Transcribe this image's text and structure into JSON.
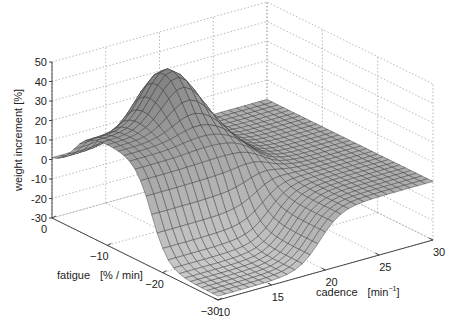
{
  "chart_data": {
    "type": "surface",
    "title": "",
    "xlabel": "cadence",
    "xunit": "min",
    "xunit_sup": "−1",
    "ylabel": "fatigue",
    "yunit": "[% / min]",
    "zlabel": "weight  increment  [%]",
    "x_range": [
      10,
      30
    ],
    "y_range": [
      -30,
      0
    ],
    "z_range": [
      -30,
      50
    ],
    "x_ticks": [
      10,
      15,
      20,
      25,
      30
    ],
    "y_ticks": [
      0,
      -10,
      -20,
      -30
    ],
    "z_ticks": [
      -30,
      -20,
      -10,
      0,
      10,
      20,
      30,
      40,
      50
    ],
    "grid": true,
    "colormap": "gray",
    "sample_points": [
      {
        "cadence": 10,
        "fatigue": 0,
        "z": 0
      },
      {
        "cadence": 30,
        "fatigue": 0,
        "z": 0
      },
      {
        "cadence": 15,
        "fatigue": -10,
        "z": 20
      },
      {
        "cadence": 12,
        "fatigue": -8,
        "z": 25
      },
      {
        "cadence": 20,
        "fatigue": -4,
        "z": 50
      },
      {
        "cadence": 25,
        "fatigue": -15,
        "z": 0
      },
      {
        "cadence": 12,
        "fatigue": -25,
        "z": -25
      },
      {
        "cadence": 30,
        "fatigue": -30,
        "z": 0
      }
    ]
  }
}
